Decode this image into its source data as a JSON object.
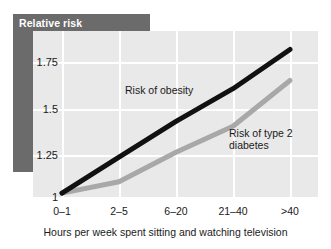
{
  "title": "Relative risk",
  "colors": {
    "band": "#6b6b6b",
    "panel": "#e9e9e9",
    "grid": "#ffffff",
    "obesity_line": "#111111",
    "diabetes_line": "#a8a8a8",
    "text": "#1a1a1a",
    "title_text": "#ffffff"
  },
  "axes": {
    "y_ticks": [
      "1",
      "1.25",
      "1.5",
      "1.75"
    ],
    "x_ticks": [
      "0–1",
      "2–5",
      "6–20",
      "21–40",
      ">40"
    ],
    "x_caption": "Hours per week spent sitting and watching television",
    "y_caption": "Relative risk"
  },
  "annotations": {
    "obesity": "Risk of obesity",
    "diabetes": "Risk of type 2\ndiabetes"
  },
  "chart_data": {
    "type": "line",
    "title": "Relative risk",
    "xlabel": "Hours per week spent sitting and watching television",
    "ylabel": "Relative risk",
    "categories": [
      "0–1",
      "2–5",
      "6–20",
      "21–40",
      ">40"
    ],
    "ylim": [
      0.97,
      1.92
    ],
    "yticks": [
      1,
      1.25,
      1.5,
      1.75
    ],
    "grid": true,
    "legend": "inline-annotations",
    "series": [
      {
        "name": "Risk of obesity",
        "color": "#111111",
        "values": [
          1.0,
          1.22,
          1.44,
          1.64,
          1.88
        ]
      },
      {
        "name": "Risk of type 2 diabetes",
        "color": "#a8a8a8",
        "values": [
          1.0,
          1.07,
          1.25,
          1.41,
          1.69
        ]
      }
    ]
  }
}
